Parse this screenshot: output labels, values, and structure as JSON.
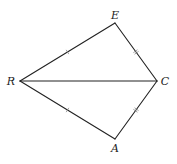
{
  "diagram": {
    "type": "kite",
    "colors": {
      "stroke": "#222222",
      "tick": "#888888",
      "label": "#222222",
      "background": "#ffffff"
    },
    "vertices": [
      {
        "id": "E",
        "label": "E",
        "x": 115,
        "y": 23,
        "lx": 115,
        "ly": 15
      },
      {
        "id": "R",
        "label": "R",
        "x": 20,
        "y": 81,
        "lx": 11,
        "ly": 81
      },
      {
        "id": "C",
        "label": "C",
        "x": 157,
        "y": 81,
        "lx": 165,
        "ly": 81
      },
      {
        "id": "A",
        "label": "A",
        "x": 115,
        "y": 139,
        "lx": 115,
        "ly": 148
      }
    ],
    "segments": [
      {
        "name": "segment-re",
        "from": "R",
        "to": "E",
        "ticks": 1
      },
      {
        "name": "segment-ec",
        "from": "E",
        "to": "C",
        "ticks": 2
      },
      {
        "name": "segment-rc",
        "from": "R",
        "to": "C",
        "ticks": 0
      },
      {
        "name": "segment-ra",
        "from": "R",
        "to": "A",
        "ticks": 1
      },
      {
        "name": "segment-ac",
        "from": "A",
        "to": "C",
        "ticks": 2
      }
    ]
  }
}
